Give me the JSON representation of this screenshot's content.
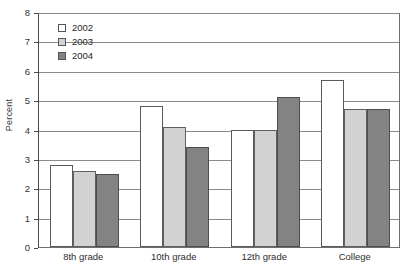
{
  "chart_data": {
    "type": "bar",
    "title": "",
    "xlabel": "",
    "ylabel": "Percent",
    "categories": [
      "8th grade",
      "10th grade",
      "12th grade",
      "College"
    ],
    "series": [
      {
        "name": "2002",
        "color": "#ffffff",
        "values": [
          2.8,
          4.8,
          4.0,
          5.7
        ]
      },
      {
        "name": "2003",
        "color": "#d2d2d2",
        "values": [
          2.6,
          4.1,
          4.0,
          4.7
        ]
      },
      {
        "name": "2004",
        "color": "#838383",
        "values": [
          2.5,
          3.4,
          5.1,
          4.7
        ]
      }
    ],
    "ylim": [
      0,
      8
    ],
    "ytick_step": 1,
    "yticks": [
      "0",
      "1",
      "2",
      "3",
      "4",
      "5",
      "6",
      "7",
      "8"
    ],
    "grid": true,
    "legend_position": "top-left",
    "legend_entries": [
      "2002",
      "2003",
      "2004"
    ]
  },
  "axis": {
    "y_label": "Percent"
  }
}
